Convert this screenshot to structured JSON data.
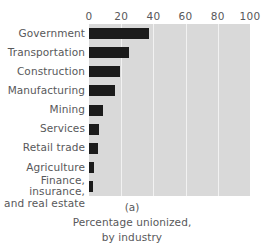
{
  "chart_data": {
    "type": "bar",
    "orientation": "horizontal",
    "title": "",
    "panel_letter": "(a)",
    "caption_lines": [
      "Percentage unionized,",
      "by industry"
    ],
    "xlabel": "",
    "ylabel": "",
    "xlim": [
      0,
      100
    ],
    "xticks": [
      0,
      20,
      40,
      60,
      80,
      100
    ],
    "xtick_labels": [
      "0",
      "20",
      "40",
      "60",
      "80",
      "100"
    ],
    "grid": true,
    "grid_axis": "x",
    "legend": null,
    "categories": [
      "Government",
      "Transportation",
      "Construction",
      "Manufacturing",
      "Mining",
      "Services",
      "Retail trade",
      "Agriculture",
      "Finance, insurance,\nand real estate"
    ],
    "values": [
      37,
      25,
      19,
      16,
      9,
      6,
      5.5,
      3,
      2.5
    ],
    "series": [
      {
        "name": "Percentage unionized",
        "values": [
          37,
          25,
          19,
          16,
          9,
          6,
          5.5,
          3,
          2.5
        ]
      }
    ]
  },
  "colors": {
    "bar": "#1b1b1b",
    "plot_background": "#d9d9d9",
    "gridline": "#f2f2f2",
    "text": "#58585a",
    "page_background": "#ffffff"
  }
}
